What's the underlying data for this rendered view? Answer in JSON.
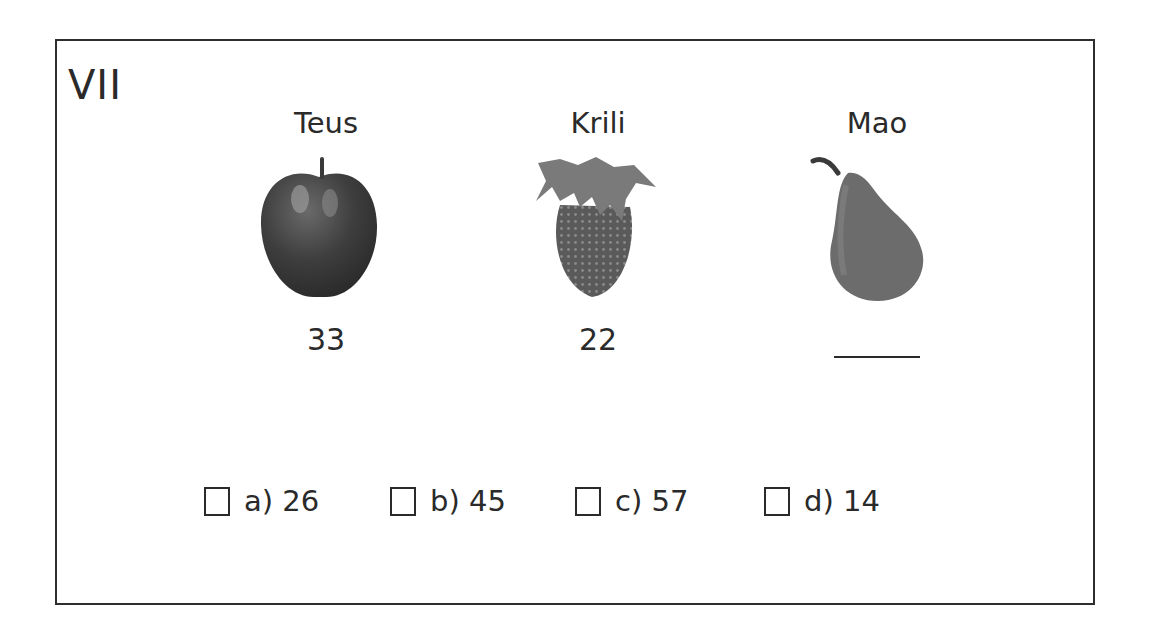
{
  "question": {
    "number": "VII",
    "items": [
      {
        "name": "Teus",
        "fruit": "apple-icon",
        "value": "33"
      },
      {
        "name": "Krili",
        "fruit": "strawberry-icon",
        "value": "22"
      },
      {
        "name": "Mao",
        "fruit": "pear-icon",
        "value": ""
      }
    ],
    "options": [
      {
        "label": "a) 26"
      },
      {
        "label": "b) 45"
      },
      {
        "label": "c) 57"
      },
      {
        "label": "d) 14"
      }
    ]
  }
}
